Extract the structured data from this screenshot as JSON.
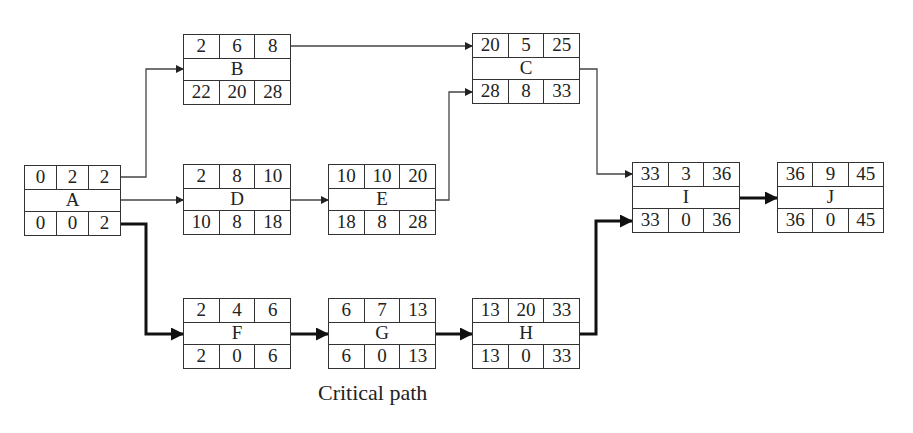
{
  "diagram": {
    "type": "activity-on-node network",
    "caption": "Critical path",
    "node_layout": "top row: ES | Duration | EF; middle: activity; bottom row: LS | Float | LF",
    "nodes": [
      {
        "id": "A",
        "top": [
          "0",
          "2",
          "2"
        ],
        "bottom": [
          "0",
          "0",
          "2"
        ]
      },
      {
        "id": "B",
        "top": [
          "2",
          "6",
          "8"
        ],
        "bottom": [
          "22",
          "20",
          "28"
        ]
      },
      {
        "id": "C",
        "top": [
          "20",
          "5",
          "25"
        ],
        "bottom": [
          "28",
          "8",
          "33"
        ]
      },
      {
        "id": "D",
        "top": [
          "2",
          "8",
          "10"
        ],
        "bottom": [
          "10",
          "8",
          "18"
        ]
      },
      {
        "id": "E",
        "top": [
          "10",
          "10",
          "20"
        ],
        "bottom": [
          "18",
          "8",
          "28"
        ]
      },
      {
        "id": "F",
        "top": [
          "2",
          "4",
          "6"
        ],
        "bottom": [
          "2",
          "0",
          "6"
        ]
      },
      {
        "id": "G",
        "top": [
          "6",
          "7",
          "13"
        ],
        "bottom": [
          "6",
          "0",
          "13"
        ]
      },
      {
        "id": "H",
        "top": [
          "13",
          "20",
          "33"
        ],
        "bottom": [
          "13",
          "0",
          "33"
        ]
      },
      {
        "id": "I",
        "top": [
          "33",
          "3",
          "36"
        ],
        "bottom": [
          "33",
          "0",
          "36"
        ]
      },
      {
        "id": "J",
        "top": [
          "36",
          "9",
          "45"
        ],
        "bottom": [
          "36",
          "0",
          "45"
        ]
      }
    ],
    "edges": [
      {
        "from": "A",
        "to": "B",
        "critical": false
      },
      {
        "from": "A",
        "to": "D",
        "critical": false
      },
      {
        "from": "A",
        "to": "F",
        "critical": true
      },
      {
        "from": "B",
        "to": "C",
        "critical": false
      },
      {
        "from": "D",
        "to": "E",
        "critical": false
      },
      {
        "from": "E",
        "to": "C",
        "critical": false
      },
      {
        "from": "C",
        "to": "I",
        "critical": false
      },
      {
        "from": "F",
        "to": "G",
        "critical": true
      },
      {
        "from": "G",
        "to": "H",
        "critical": true
      },
      {
        "from": "H",
        "to": "I",
        "critical": true
      },
      {
        "from": "I",
        "to": "J",
        "critical": true
      }
    ],
    "critical_path": [
      "A",
      "F",
      "G",
      "H",
      "I",
      "J"
    ],
    "colors": {
      "line": "#333333",
      "background": "#ffffff"
    }
  }
}
